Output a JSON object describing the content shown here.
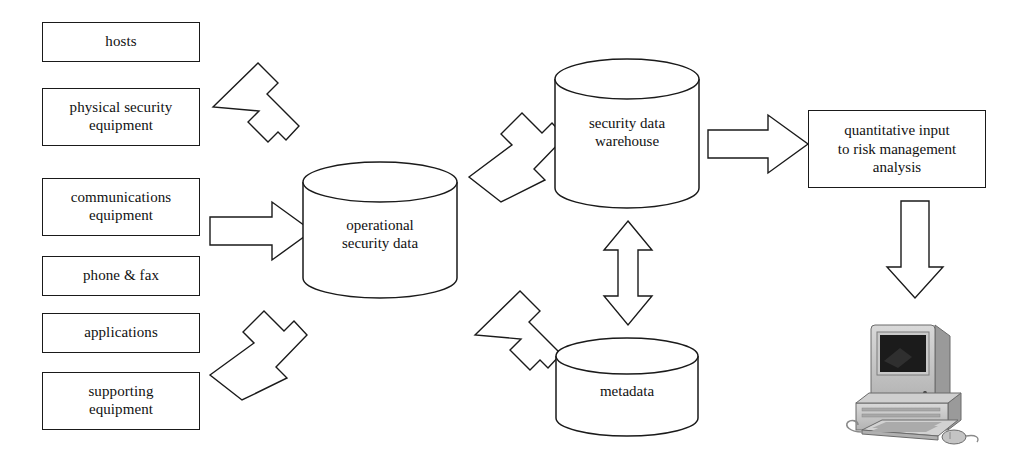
{
  "diagram": {
    "background_color": "#ffffff",
    "line_color": "#1a1a1a"
  },
  "sources": [
    {
      "id": "hosts",
      "label": "hosts"
    },
    {
      "id": "physical-security-equipment",
      "label": "physical security\nequipment"
    },
    {
      "id": "communications-equipment",
      "label": "communications\nequipment"
    },
    {
      "id": "phone-fax",
      "label": "phone & fax"
    },
    {
      "id": "applications",
      "label": "applications"
    },
    {
      "id": "supporting-equipment",
      "label": "supporting\nequipment"
    }
  ],
  "stores": [
    {
      "id": "operational-security-data",
      "label": "operational\nsecurity data"
    },
    {
      "id": "security-data-warehouse",
      "label": "security data\nwarehouse"
    },
    {
      "id": "metadata",
      "label": "metadata"
    }
  ],
  "output": {
    "id": "quantitative-input",
    "label": "quantitative input\nto risk management\nanalysis"
  },
  "terminal": {
    "id": "desktop-computer",
    "icon": "computer-icon"
  },
  "arrows": [
    {
      "id": "arrow-sources-top-to-operational",
      "icon": "arrow-down-right-icon",
      "direction": "down-right"
    },
    {
      "id": "arrow-sources-mid-to-operational",
      "icon": "arrow-right-icon",
      "direction": "right"
    },
    {
      "id": "arrow-sources-bottom-to-operational",
      "icon": "arrow-up-right-icon",
      "direction": "up-right"
    },
    {
      "id": "arrow-operational-to-warehouse",
      "icon": "arrow-up-right-icon",
      "direction": "up-right"
    },
    {
      "id": "arrow-operational-to-metadata",
      "icon": "arrow-down-right-icon",
      "direction": "down-right"
    },
    {
      "id": "arrow-warehouse-metadata-bidirectional",
      "icon": "arrow-up-down-icon",
      "direction": "up-down"
    },
    {
      "id": "arrow-warehouse-to-output",
      "icon": "arrow-right-icon",
      "direction": "right"
    },
    {
      "id": "arrow-output-to-computer",
      "icon": "arrow-down-icon",
      "direction": "down"
    }
  ]
}
